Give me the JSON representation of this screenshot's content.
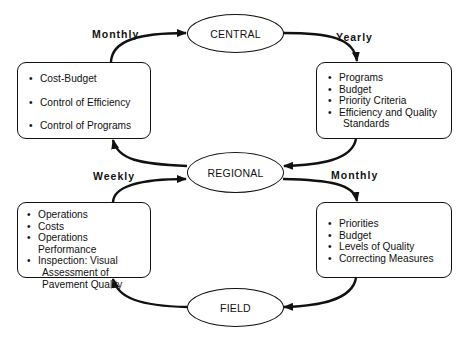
{
  "nodes": {
    "central": {
      "label": "CENTRAL"
    },
    "regional": {
      "label": "REGIONAL"
    },
    "field": {
      "label": "FIELD"
    }
  },
  "boxes": {
    "top_left": {
      "items": [
        {
          "text": "Cost-Budget"
        },
        {
          "text": "Control of Efficiency"
        },
        {
          "text": "Control of Programs"
        }
      ]
    },
    "top_right": {
      "items": [
        {
          "text": "Programs"
        },
        {
          "text": "Budget"
        },
        {
          "text": "Priority Criteria"
        },
        {
          "text": "Efficiency and Quality",
          "cont": "Standards"
        }
      ]
    },
    "bottom_left": {
      "items": [
        {
          "text": "Operations"
        },
        {
          "text": "Costs"
        },
        {
          "text": "Operations Performance"
        },
        {
          "text": "Inspection: Visual",
          "cont": "Assessment of",
          "cont2": "Pavement Quality"
        }
      ]
    },
    "bottom_right": {
      "items": [
        {
          "text": "Priorities"
        },
        {
          "text": "Budget"
        },
        {
          "text": "Levels of Quality"
        },
        {
          "text": "Correcting Measures"
        }
      ]
    }
  },
  "edge_labels": {
    "top_left": "Monthly",
    "top_right": "Yearly",
    "bottom_left": "Weekly",
    "bottom_right": "Monthly"
  },
  "bullet": "•",
  "colors": {
    "stroke": "#111111",
    "background": "#ffffff"
  }
}
